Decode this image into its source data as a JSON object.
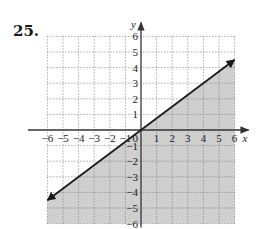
{
  "problem": {
    "number": "25."
  },
  "chart_data": {
    "type": "line",
    "title": "",
    "subtitle": "",
    "xlabel": "x",
    "ylabel": "y",
    "xlim": [
      -6,
      6
    ],
    "ylim": [
      -6,
      6
    ],
    "grid": true,
    "grid_style": "dotted",
    "x_ticks": [
      -6,
      -5,
      -4,
      -3,
      -2,
      -1,
      1,
      2,
      3,
      4,
      5,
      6
    ],
    "y_ticks": [
      -6,
      -5,
      -4,
      -3,
      -2,
      -1,
      1,
      2,
      3,
      4,
      5,
      6
    ],
    "x_tick_labels": [
      "−6",
      "−5",
      "−4",
      "−3",
      "−2",
      "−1",
      "1",
      "2",
      "3",
      "4",
      "5",
      "6"
    ],
    "y_tick_labels": [
      "−6",
      "−5",
      "−4",
      "−3",
      "−2",
      "−1",
      "1",
      "2",
      "3",
      "4",
      "5",
      "6"
    ],
    "origin_label": "0",
    "series": [
      {
        "name": "boundary line y = (3/4)x",
        "style": "solid",
        "arrows": "both",
        "x": [
          -6,
          6
        ],
        "y": [
          -4.5,
          4.5
        ]
      }
    ],
    "shaded_region": {
      "description": "region below the line",
      "inequality": "y ≤ (3/4)x",
      "fill": "#cfcfcf"
    },
    "legend": null
  },
  "colors": {
    "axis": "#333333",
    "grid": "#777777",
    "line": "#1a1a1a",
    "shade": "#cfcfcf"
  }
}
